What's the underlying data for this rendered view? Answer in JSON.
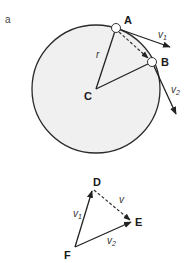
{
  "panel_label": "a",
  "circle": {
    "center_label": "C",
    "radius_label": "r",
    "fill": "#f0f0f0",
    "stroke": "#2a2a2a"
  },
  "points": {
    "A": "A",
    "B": "B"
  },
  "velocity_labels": {
    "v1_base": "v",
    "v1_sub": "1",
    "v2_base": "v",
    "v2_sub": "2"
  },
  "triangle": {
    "D": "D",
    "E": "E",
    "F": "F",
    "side_FD_base": "v",
    "side_FD_sub": "1",
    "side_FE_base": "v",
    "side_FE_sub": "2",
    "side_DE": "v"
  }
}
